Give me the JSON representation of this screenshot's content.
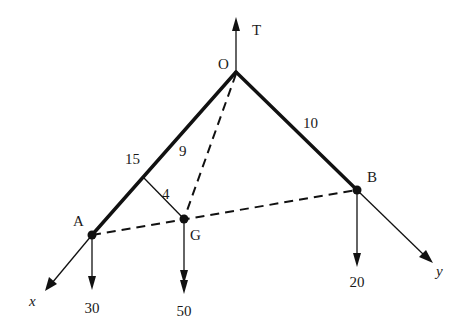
{
  "diagram": {
    "type": "3D rigid body statics free-body diagram",
    "points": {
      "O": {
        "label": "O",
        "x": 236,
        "y": 72
      },
      "A": {
        "label": "A",
        "x": 92,
        "y": 235
      },
      "B": {
        "label": "B",
        "x": 357,
        "y": 190
      },
      "G": {
        "label": "G",
        "x": 184,
        "y": 219
      }
    },
    "members": [
      {
        "from": "O",
        "to": "A",
        "style": "thick",
        "length_label": "15"
      },
      {
        "from": "O",
        "to": "B",
        "style": "thick",
        "length_label": "10"
      },
      {
        "from": "O",
        "to": "G",
        "style": "dashed"
      },
      {
        "from": "A",
        "to": "B",
        "style": "dashed"
      }
    ],
    "dimensions": {
      "OA_length": "15",
      "OB_length": "10",
      "O_to_foot_along_OA": "9",
      "perpendicular_G_to_OA": "4"
    },
    "forces": [
      {
        "name": "T",
        "label": "T",
        "at": "O",
        "direction": "up"
      },
      {
        "name": "load_A",
        "label": "30",
        "at": "A",
        "direction": "down"
      },
      {
        "name": "load_G",
        "label": "50",
        "at": "G",
        "direction": "down"
      },
      {
        "name": "load_B",
        "label": "20",
        "at": "B",
        "direction": "down"
      }
    ],
    "axes": [
      {
        "label": "x",
        "along": "OA extended"
      },
      {
        "label": "y",
        "along": "OB extended"
      }
    ],
    "labels": {
      "O": "O",
      "A": "A",
      "B": "B",
      "G": "G",
      "T": "T",
      "x_axis": "x",
      "y_axis": "y",
      "len_15": "15",
      "len_9": "9",
      "len_4": "4",
      "len_10": "10",
      "force_30": "30",
      "force_50": "50",
      "force_20": "20"
    }
  }
}
